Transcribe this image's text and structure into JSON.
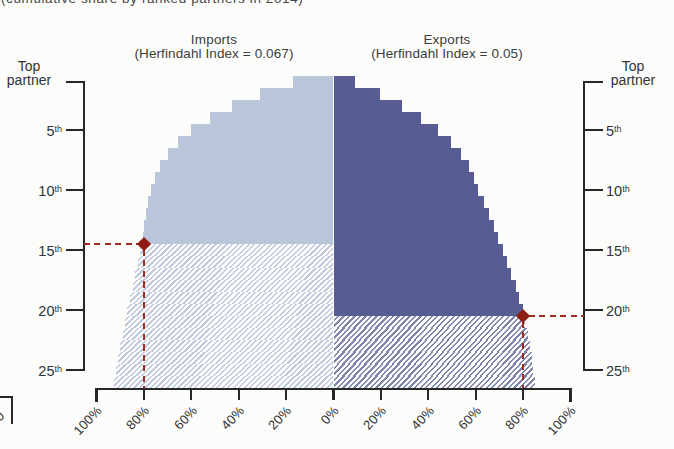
{
  "page": {
    "caption": "(cumulative share by ranked partners in 2014)"
  },
  "panels": {
    "imports": {
      "title": "Imports",
      "subtitle": "(Herfindahl Index = 0.067)"
    },
    "exports": {
      "title": "Exports",
      "subtitle": "(Herfindahl Index = 0.05)"
    }
  },
  "axes": {
    "rank_axis_title_line1": "Top",
    "rank_axis_title_line2": "partner",
    "rank_tick_labels": [
      {
        "value": "5",
        "suffix": "th"
      },
      {
        "value": "10",
        "suffix": "th"
      },
      {
        "value": "15",
        "suffix": "th"
      },
      {
        "value": "20",
        "suffix": "th"
      },
      {
        "value": "25",
        "suffix": "th"
      }
    ],
    "x_tick_labels": [
      "100%",
      "80%",
      "60%",
      "40%",
      "20%",
      "0%",
      "20%",
      "40%",
      "60%",
      "80%",
      "100%"
    ]
  },
  "fragment": {
    "partial_tick_label": "0"
  },
  "colors": {
    "imports_solid": "#b9c5d8",
    "exports_solid": "#575d92",
    "imports_hatch_stripe": "#c2cbde",
    "exports_hatch_stripe": "#7e86ad",
    "accent_red": "#a32a1e",
    "diamond_red": "#8d1d12",
    "axis": "#272727"
  },
  "chart_data": {
    "type": "bar",
    "style": "back-to-back cumulative stepped dome (imports left, exports right)",
    "title": "(cumulative share by ranked partners in 2014)",
    "rank_ticks": [
      "Top partner",
      "5th",
      "10th",
      "15th",
      "20th",
      "25th"
    ],
    "x_ticks_pct": [
      100,
      80,
      60,
      40,
      20,
      0,
      20,
      40,
      60,
      80,
      100
    ],
    "categories_ranks": [
      1,
      2,
      3,
      4,
      5,
      6,
      7,
      8,
      9,
      10,
      11,
      12,
      13,
      14,
      15,
      16,
      17,
      18,
      19,
      20,
      21,
      22,
      23,
      24,
      25,
      26
    ],
    "series": [
      {
        "name": "Imports",
        "herfindahl_index": 0.067,
        "cumulative_share_pct": [
          17,
          31,
          43,
          52,
          60,
          65.5,
          70,
          73,
          75.3,
          77,
          78.2,
          79.2,
          79.9,
          80.4,
          81.5,
          82.6,
          83.7,
          84.8,
          85.9,
          87,
          88,
          89,
          90,
          90.9,
          91.8,
          92.6
        ],
        "solid_through_rank": 14,
        "marker": {
          "share_pct": 80,
          "rank": 14
        }
      },
      {
        "name": "Exports",
        "herfindahl_index": 0.05,
        "cumulative_share_pct": [
          9,
          19.5,
          29,
          37,
          44,
          49.5,
          53.8,
          57.2,
          59.3,
          61,
          63.3,
          65.5,
          67.6,
          69.6,
          71.5,
          73.3,
          75.1,
          76.8,
          78.4,
          80,
          81,
          81.9,
          82.8,
          83.6,
          84.3,
          85
        ],
        "solid_through_rank": 20,
        "marker": {
          "share_pct": 80,
          "rank": 20
        }
      }
    ],
    "legend": "solid fill = partners up to 80% threshold; hatched = remaining ranked partners",
    "grid": false
  }
}
